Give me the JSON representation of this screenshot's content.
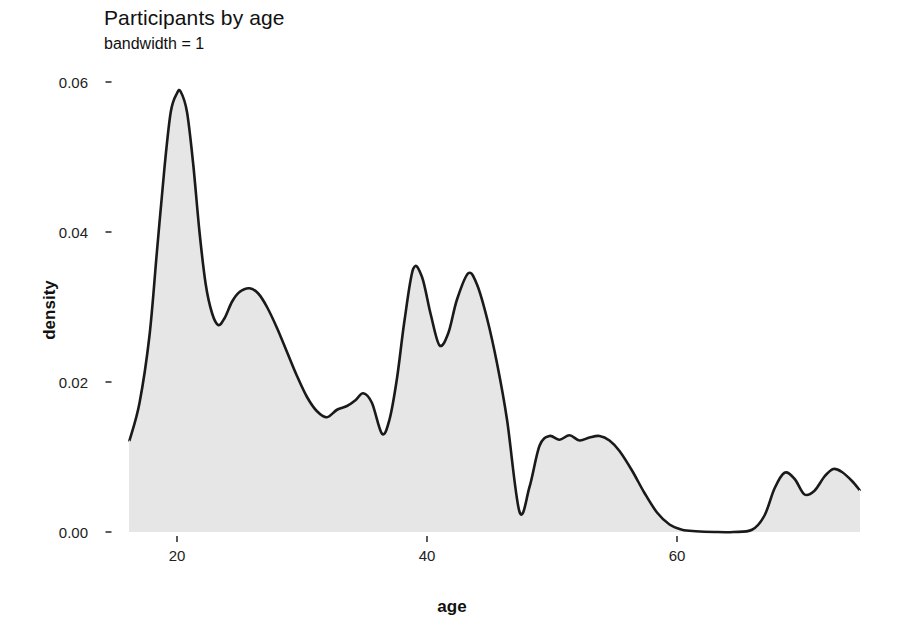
{
  "chart_data": {
    "type": "area",
    "title": "Participants by age",
    "subtitle": "bandwidth = 1",
    "xlabel": "age",
    "ylabel": "density",
    "xlim": [
      15.0,
      75.0
    ],
    "ylim": [
      0.0,
      0.0625
    ],
    "xticks": [
      20,
      40,
      60
    ],
    "xtick_labels": [
      "20",
      "40",
      "60"
    ],
    "yticks": [
      0.0,
      0.02,
      0.04,
      0.06
    ],
    "ytick_labels": [
      "0.00",
      "0.02",
      "0.04",
      "0.06"
    ],
    "grid": false,
    "legend": false,
    "line_color": "#1a1a1a",
    "fill_color": "#e6e6e6",
    "panel_color": "#ffffff",
    "series": [
      {
        "name": "density",
        "x": [
          16.2,
          17.0,
          17.8,
          18.4,
          19.0,
          19.5,
          20.0,
          20.3,
          20.8,
          21.3,
          21.8,
          22.3,
          22.8,
          23.3,
          23.8,
          24.4,
          25.0,
          25.8,
          26.5,
          27.2,
          28.0,
          28.8,
          29.6,
          30.4,
          31.2,
          32.0,
          32.8,
          33.6,
          34.3,
          34.9,
          35.6,
          36.4,
          37.0,
          37.6,
          38.2,
          38.9,
          39.6,
          40.3,
          41.0,
          41.7,
          42.4,
          43.3,
          44.0,
          44.8,
          45.6,
          46.4,
          47.4,
          48.2,
          49.0,
          49.8,
          50.6,
          51.4,
          52.2,
          53.0,
          53.8,
          54.6,
          55.4,
          56.4,
          57.4,
          58.4,
          59.4,
          60.4,
          61.5,
          63.0,
          64.5,
          66.0,
          67.0,
          67.8,
          68.6,
          69.4,
          70.2,
          71.0,
          71.8,
          72.5,
          73.2,
          74.0,
          74.6
        ],
        "y": [
          0.0122,
          0.0172,
          0.0262,
          0.0375,
          0.0486,
          0.056,
          0.0585,
          0.0587,
          0.056,
          0.049,
          0.04,
          0.033,
          0.0292,
          0.0276,
          0.0285,
          0.0307,
          0.032,
          0.0325,
          0.0318,
          0.03,
          0.0272,
          0.024,
          0.0208,
          0.018,
          0.0161,
          0.0153,
          0.0163,
          0.0168,
          0.0176,
          0.0185,
          0.0172,
          0.0131,
          0.015,
          0.0205,
          0.0282,
          0.0351,
          0.034,
          0.029,
          0.0249,
          0.0265,
          0.031,
          0.0345,
          0.033,
          0.0285,
          0.0225,
          0.015,
          0.0027,
          0.006,
          0.0115,
          0.0128,
          0.0123,
          0.0129,
          0.0122,
          0.0126,
          0.0128,
          0.0122,
          0.0108,
          0.0082,
          0.0052,
          0.0026,
          0.001,
          0.0003,
          0.0001,
          0.0,
          0.0,
          0.0003,
          0.0022,
          0.0058,
          0.0079,
          0.0071,
          0.005,
          0.0055,
          0.0074,
          0.0084,
          0.008,
          0.0068,
          0.0056
        ]
      }
    ]
  }
}
